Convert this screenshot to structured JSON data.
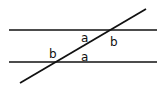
{
  "diagram": {
    "type": "parallel-lines-transversal",
    "lines": [
      {
        "name": "top-parallel-line",
        "x1": 9,
        "y1": 30,
        "x2": 157,
        "y2": 30
      },
      {
        "name": "bottom-parallel-line",
        "x1": 9,
        "y1": 62,
        "x2": 157,
        "y2": 62
      },
      {
        "name": "transversal",
        "x1": 20,
        "y1": 83,
        "x2": 146,
        "y2": 9
      }
    ],
    "labels": [
      {
        "text": "a",
        "x": 81,
        "y": 42
      },
      {
        "text": "b",
        "x": 110,
        "y": 46
      },
      {
        "text": "b",
        "x": 49,
        "y": 58
      },
      {
        "text": "a",
        "x": 81,
        "y": 61
      }
    ],
    "colors": {
      "stroke": "#111111",
      "background": "#ffffff"
    }
  }
}
